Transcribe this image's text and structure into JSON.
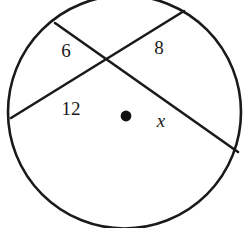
{
  "figure": {
    "kind": "geometry-diagram",
    "background_color": "#ffffff",
    "stroke_color": "#1a1a1a",
    "label_color": "#1a1a1a"
  },
  "circle": {
    "name": "circle-outline",
    "center_x": 124.5,
    "center_y": 112,
    "radius": 116.5,
    "stroke_width": 2.6,
    "fill": "none"
  },
  "center_point": {
    "name": "center-dot",
    "x": 126,
    "y": 116,
    "radius": 5.4,
    "fill": "#111111"
  },
  "intersection": {
    "name": "chord-intersection-point",
    "x": 105,
    "y": 58
  },
  "chords": [
    {
      "id": "chord-a",
      "label_near": "6",
      "label_far": "x",
      "x1": 55,
      "y1": 23,
      "x2": 238,
      "y2": 152,
      "stroke_width": 2.6
    },
    {
      "id": "chord-b",
      "label_near": "12",
      "label_far": "8",
      "x1": 11,
      "y1": 118,
      "x2": 184,
      "y2": 11,
      "stroke_width": 2.6
    }
  ],
  "labels": [
    {
      "id": "segment-label-6",
      "text": "6",
      "x": 66,
      "y": 50,
      "style": "number",
      "segment": "chord-a-upper-left"
    },
    {
      "id": "segment-label-8",
      "text": "8",
      "x": 159,
      "y": 47,
      "style": "number",
      "segment": "chord-b-upper-right"
    },
    {
      "id": "segment-label-12",
      "text": "12",
      "x": 71,
      "y": 108,
      "style": "number",
      "segment": "chord-b-lower-left"
    },
    {
      "id": "segment-label-x",
      "text": "x",
      "x": 161,
      "y": 120,
      "style": "variable",
      "segment": "chord-a-lower-right"
    }
  ],
  "chart_data": {
    "type": "diagram",
    "title": "",
    "segments": [
      {
        "name": "6",
        "value": 6,
        "known": true,
        "chord": "chord-a"
      },
      {
        "name": "8",
        "value": 8,
        "known": true,
        "chord": "chord-b"
      },
      {
        "name": "12",
        "value": 12,
        "known": true,
        "chord": "chord-b"
      },
      {
        "name": "x",
        "value": null,
        "known": false,
        "chord": "chord-a"
      }
    ],
    "relation": "6 * x = 12 * 8"
  }
}
